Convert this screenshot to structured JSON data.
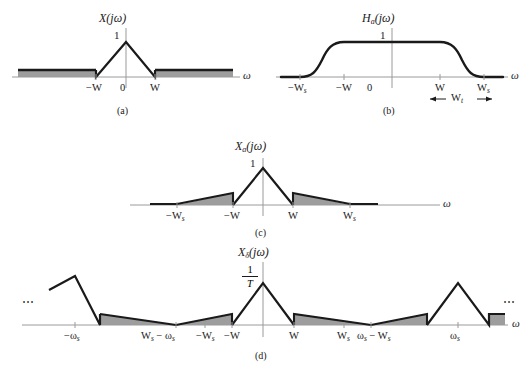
{
  "figure": {
    "type": "signal-spectra-diagram",
    "colors": {
      "curve": "#1a1a1a",
      "axis": "#9a9a9a",
      "shade": "#9d9d9d",
      "background": "#ffffff"
    },
    "omega_symbol": "ω"
  },
  "panels": [
    {
      "id": "a",
      "caption": "(a)",
      "title": "X(jω)",
      "title_main": "X(jω)",
      "amplitude_label": "1",
      "axis_label": "ω",
      "ticks": [
        {
          "label": "−W",
          "value": "-W"
        },
        {
          "label": "0",
          "value": "0"
        },
        {
          "label": "W",
          "value": "W"
        }
      ],
      "description": "Triangular spectrum peaking at 1 between -W and W with gray out-of-band shading"
    },
    {
      "id": "b",
      "caption": "(b)",
      "title": "H",
      "title_sub": "a",
      "title_tail": "(jω)",
      "amplitude_label": "1",
      "axis_label": "ω",
      "ticks": [
        {
          "label": "−W",
          "sub": "s",
          "value": "-Ws"
        },
        {
          "label": "−W",
          "sub": "",
          "value": "-W"
        },
        {
          "label": "0",
          "sub": "",
          "value": "0"
        },
        {
          "label": "W",
          "sub": "",
          "value": "W"
        },
        {
          "label": "W",
          "sub": "s",
          "value": "Ws"
        }
      ],
      "transition_label": "W",
      "transition_sub": "t",
      "description": "Anti-aliasing filter magnitude, flat passband 1 from -W to W, raised-cosine rolloff to zero at ±Ws"
    },
    {
      "id": "c",
      "caption": "(c)",
      "title": "X",
      "title_sub": "a",
      "title_tail": "(jω)",
      "amplitude_label": "1",
      "axis_label": "ω",
      "ticks": [
        {
          "label": "−W",
          "sub": "s",
          "value": "-Ws"
        },
        {
          "label": "−W",
          "sub": "",
          "value": "-W"
        },
        {
          "label": "W",
          "sub": "",
          "value": "W"
        },
        {
          "label": "W",
          "sub": "s",
          "value": "Ws"
        }
      ],
      "description": "Filtered spectrum: main triangle plus shaded tapered residual lobes between ±W and ±Ws"
    },
    {
      "id": "d",
      "caption": "(d)",
      "title": "X",
      "title_sub": "δ",
      "title_tail": "(jω)",
      "amplitude_numerator": "1",
      "amplitude_denominator": "T",
      "axis_label": "ω",
      "ellipsis_left": "⋯",
      "ellipsis_right": "⋯",
      "ticks": [
        {
          "label": "−ω",
          "sub": "s",
          "value": "-ws"
        },
        {
          "label": "W",
          "sub": "s",
          "tail": " − ω",
          "tail_sub": "s",
          "value": "Ws-ws"
        },
        {
          "label": "−W",
          "sub": "s",
          "value": "-Ws"
        },
        {
          "label": "−W",
          "sub": "",
          "value": "-W"
        },
        {
          "label": "W",
          "sub": "",
          "value": "W"
        },
        {
          "label": "W",
          "sub": "s",
          "value": "Ws"
        },
        {
          "label": "ω",
          "sub": "s",
          "tail": " − W",
          "tail_sub": "s",
          "value": "ws-Ws"
        },
        {
          "label": "ω",
          "sub": "s",
          "value": "ws"
        }
      ],
      "description": "Sampled signal spectrum: periodic replicas of amplitude 1/T at multiples of ωs with shaded aliasing tails"
    }
  ]
}
